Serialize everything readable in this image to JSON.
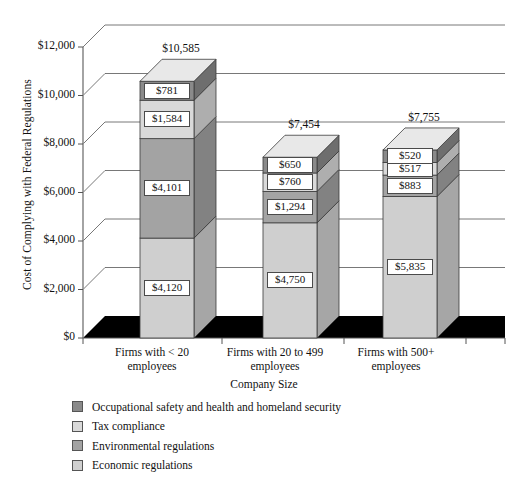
{
  "chart_data": {
    "type": "bar",
    "subtype": "stacked-3d-column",
    "title": "",
    "xlabel": "Company Size",
    "ylabel": "Cost of Complying with Federal Regulations",
    "categories": [
      "Firms with < 20 employees",
      "Firms with 20 to 499 employees",
      "Firms with 500+ employees"
    ],
    "category_lines": [
      [
        "Firms with < 20",
        "employees"
      ],
      [
        "Firms with 20 to 499",
        "employees"
      ],
      [
        "Firms with 500+",
        "employees"
      ]
    ],
    "series": [
      {
        "name": "Economic regulations",
        "color": "#cfcfcf",
        "values": [
          4120,
          4750,
          5835
        ],
        "labels": [
          "$4,120",
          "$4,750",
          "$5,835"
        ]
      },
      {
        "name": "Environmental regulations",
        "color": "#a3a3a3",
        "values": [
          4101,
          1294,
          883
        ],
        "labels": [
          "$4,101",
          "$1,294",
          "$883"
        ]
      },
      {
        "name": "Tax compliance",
        "color": "#d9d9d9",
        "values": [
          1584,
          760,
          517
        ],
        "labels": [
          "$1,584",
          "$760",
          "$517"
        ]
      },
      {
        "name": "Occupational safety and health and homeland security",
        "color": "#8a8a8a",
        "values": [
          781,
          650,
          520
        ],
        "labels": [
          "$781",
          "$650",
          "$520"
        ]
      }
    ],
    "totals": [
      10585,
      7454,
      7755
    ],
    "total_labels": [
      "$10,585",
      "$7,454",
      "$7,755"
    ],
    "ylim": [
      0,
      12000
    ],
    "ytick_values": [
      0,
      2000,
      4000,
      6000,
      8000,
      10000,
      12000
    ],
    "ytick_labels": [
      "$0",
      "$2,000",
      "$4,000",
      "$6,000",
      "$8,000",
      "$10,000",
      "$12,000"
    ],
    "grid": true,
    "legend_position": "bottom-left"
  },
  "legend": {
    "items": [
      {
        "label": "Occupational safety and health and homeland security",
        "color": "#8a8a8a",
        "swatch_name": "legend-swatch-occupational-safety"
      },
      {
        "label": "Tax compliance",
        "color": "#d9d9d9",
        "swatch_name": "legend-swatch-tax-compliance"
      },
      {
        "label": "Environmental regulations",
        "color": "#a3a3a3",
        "swatch_name": "legend-swatch-environmental"
      },
      {
        "label": "Economic regulations",
        "color": "#cfcfcf",
        "swatch_name": "legend-swatch-economic"
      }
    ]
  },
  "axes": {
    "y_title": "Cost of Complying with Federal Regulations",
    "x_title": "Company Size"
  }
}
